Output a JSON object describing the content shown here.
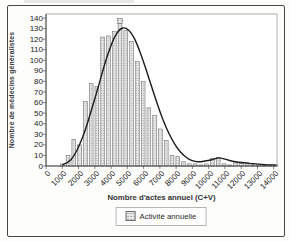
{
  "chart_data": {
    "type": "bar",
    "title": "",
    "xlabel": "Nombre d'actes annuel (C+V)",
    "ylabel": "Nombre de médecins généralistes",
    "legend": [
      {
        "label": "Activité annuelle",
        "marker": "hatched-square"
      }
    ],
    "legend_position": "bottom-center",
    "grid": false,
    "xlim": [
      0,
      14200
    ],
    "ylim": [
      0,
      140
    ],
    "xticks": [
      0,
      1000,
      2000,
      3000,
      4000,
      5000,
      6000,
      7000,
      8000,
      9000,
      10000,
      11000,
      12000,
      13000,
      14000
    ],
    "yticks": [
      0,
      10,
      20,
      30,
      40,
      50,
      60,
      70,
      80,
      90,
      100,
      110,
      120,
      130,
      140
    ],
    "x": [
      1000,
      1355,
      1710,
      2065,
      2420,
      2775,
      3130,
      3485,
      3840,
      4195,
      4550,
      4905,
      5260,
      5615,
      5970,
      6325,
      6680,
      7035,
      7390,
      7745,
      8100,
      8455,
      8810,
      9165,
      9520,
      9875,
      10230,
      10585,
      10940,
      11295,
      11650,
      12005,
      12360,
      12715,
      13070,
      13425,
      13780,
      14135
    ],
    "values": [
      2,
      10,
      25,
      20,
      61,
      78,
      75,
      122,
      123,
      127,
      135,
      128,
      118,
      99,
      80,
      55,
      48,
      35,
      24,
      10,
      9,
      4,
      2,
      2,
      1,
      2,
      7,
      8,
      2,
      1,
      3,
      3,
      2,
      1,
      1,
      1,
      1,
      1
    ],
    "smoothed_curve_values": [
      1,
      3,
      9,
      20,
      34,
      52,
      70,
      90,
      108,
      122,
      130,
      131,
      126,
      115,
      100,
      83,
      66,
      50,
      36,
      25,
      16,
      10,
      6,
      4,
      4,
      5,
      6,
      8,
      7,
      5,
      4,
      3,
      3,
      2,
      2,
      1,
      1,
      1
    ],
    "peak_marker_index": 10
  },
  "colors": {
    "bar_fill": "#e6e6e6",
    "bar_dot": "#8f8f8f",
    "bar_stroke": "#5f5f5f",
    "curve": "#1c1c1c",
    "plot_border": "#8c8c8c",
    "axis": "#3c3c3c",
    "tick_text": "#222222"
  }
}
